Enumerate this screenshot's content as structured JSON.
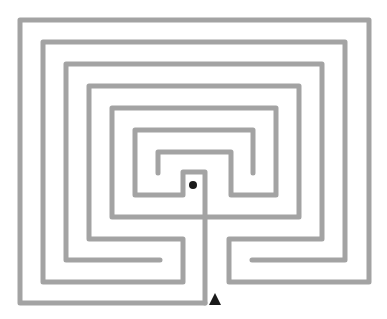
{
  "diagram": {
    "type": "labyrinth",
    "width": 387,
    "height": 319,
    "colors": {
      "wall": "#a3a3a3",
      "background": "#ffffff",
      "marker": "#1a1a1a"
    },
    "walls": [
      {
        "id": "path-a",
        "points": [
          [
            205,
            303
          ],
          [
            20,
            303
          ],
          [
            20,
            20
          ],
          [
            369,
            20
          ],
          [
            369,
            282
          ],
          [
            229,
            282
          ],
          [
            229,
            239
          ],
          [
            322,
            239
          ],
          [
            322,
            64
          ],
          [
            66,
            64
          ],
          [
            66,
            260
          ],
          [
            160,
            260
          ]
        ]
      },
      {
        "id": "path-b",
        "points": [
          [
            252,
            260
          ],
          [
            345,
            260
          ],
          [
            345,
            42
          ],
          [
            43,
            42
          ],
          [
            43,
            282
          ],
          [
            183,
            282
          ],
          [
            183,
            239
          ],
          [
            89,
            239
          ],
          [
            89,
            86
          ],
          [
            299,
            86
          ],
          [
            299,
            217
          ],
          [
            205,
            217
          ]
        ]
      },
      {
        "id": "path-c",
        "points": [
          [
            205,
            217
          ],
          [
            112,
            217
          ],
          [
            112,
            108
          ],
          [
            276,
            108
          ],
          [
            276,
            195
          ],
          [
            231,
            195
          ],
          [
            231,
            152
          ],
          [
            158,
            152
          ],
          [
            158,
            173
          ]
        ]
      },
      {
        "id": "path-d",
        "points": [
          [
            253,
            173
          ],
          [
            253,
            130
          ],
          [
            135,
            130
          ],
          [
            135,
            195
          ],
          [
            183,
            195
          ],
          [
            183,
            172
          ],
          [
            205,
            172
          ],
          [
            205,
            303
          ]
        ]
      }
    ],
    "markers": {
      "goal": {
        "shape": "dot",
        "cx": 193,
        "cy": 185,
        "r": 4
      },
      "entrance": {
        "shape": "triangle",
        "points": [
          [
            209,
            305
          ],
          [
            215,
            293
          ],
          [
            221,
            305
          ]
        ]
      }
    }
  }
}
